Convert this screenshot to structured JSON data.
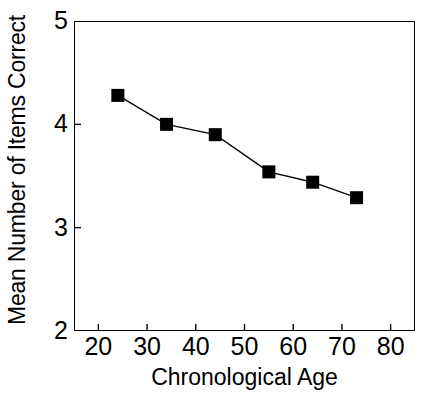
{
  "chart_data": {
    "type": "line",
    "title": "",
    "xlabel": "Chronological Age",
    "ylabel": "Mean Number of Items Correct",
    "xlim": [
      15,
      85
    ],
    "ylim": [
      2,
      5
    ],
    "xticks": [
      20,
      30,
      40,
      50,
      60,
      70,
      80
    ],
    "yticks": [
      2,
      3,
      4,
      5
    ],
    "xtick_labels": [
      "20",
      "30",
      "40",
      "50",
      "60",
      "70",
      "80"
    ],
    "ytick_labels": [
      "2",
      "3",
      "4",
      "5"
    ],
    "grid": false,
    "legend": null,
    "marker": "filled-square",
    "marker_color": "#000000",
    "line_color": "#000000",
    "series": [
      {
        "name": "Mean Number of Items Correct",
        "x": [
          24,
          34,
          44,
          55,
          64,
          73
        ],
        "values": [
          4.28,
          4.0,
          3.9,
          3.54,
          3.44,
          3.29
        ]
      }
    ]
  }
}
